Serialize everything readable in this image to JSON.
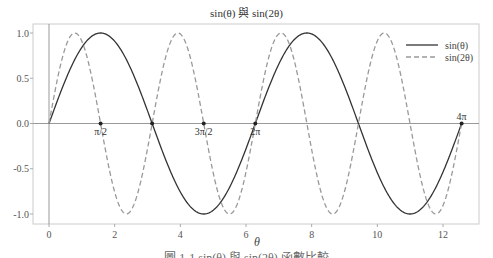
{
  "chart_data": {
    "type": "line",
    "title": "sin(θ) 與 sin(2θ)",
    "xlabel": "θ",
    "ylabel": "",
    "xlim": [
      -0.5,
      13.1
    ],
    "ylim": [
      -1.1,
      1.1
    ],
    "xticks": [
      0,
      2,
      4,
      6,
      8,
      10,
      12
    ],
    "xtick_labels": [
      "0",
      "2",
      "4",
      "6",
      "8",
      "10",
      "12"
    ],
    "yticks": [
      1.0,
      0.5,
      0.0,
      -0.5,
      -1.0
    ],
    "ytick_labels": [
      "1.0",
      "0.5",
      "0.0",
      "-0.5",
      "-1.0"
    ],
    "grid": false,
    "legend_position": "upper right",
    "x_range": [
      0,
      12.566
    ],
    "series": [
      {
        "name": "sin(θ)",
        "function": "sin(x)",
        "style": "solid",
        "color": "#333333"
      },
      {
        "name": "sin(2θ)",
        "function": "sin(2x)",
        "style": "dashed",
        "color": "#999999"
      }
    ],
    "annotations": [
      {
        "x": 1.5708,
        "y": 0,
        "label": "π/2"
      },
      {
        "x": 3.1416,
        "y": 0,
        "label": ""
      },
      {
        "x": 4.7124,
        "y": 0,
        "label": "3π/2"
      },
      {
        "x": 6.2832,
        "y": 0,
        "label": "2π"
      },
      {
        "x": 12.5664,
        "y": 0,
        "label": "4π"
      }
    ],
    "reference_lines": [
      {
        "type": "horizontal",
        "y": 0
      },
      {
        "type": "vertical",
        "x": 0
      }
    ]
  },
  "page": {
    "title": "sin(θ) 與 sin(2θ)",
    "caption": "圖 1-1  sin(θ) 與 sin(2θ) 函數比較"
  }
}
